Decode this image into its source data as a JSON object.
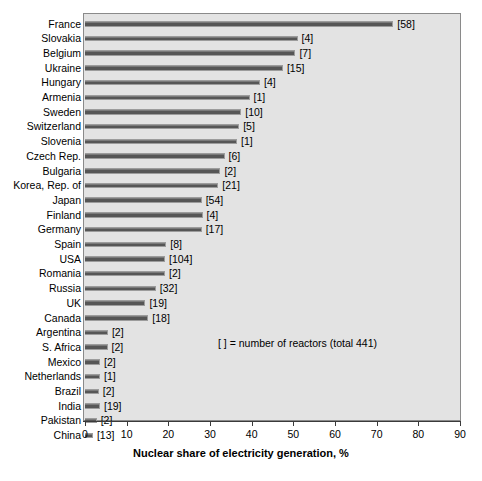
{
  "chart_data": {
    "type": "bar",
    "orientation": "horizontal",
    "title": "",
    "xlabel": "Nuclear share of electricity generation, %",
    "ylabel": "",
    "xlim": [
      0,
      90
    ],
    "xticks": [
      0,
      10,
      20,
      30,
      40,
      50,
      60,
      70,
      80,
      90
    ],
    "grid": false,
    "legend": null,
    "annotation": "[  ] = number of reactors (total 441)",
    "value_label_format": "[n_reactors]",
    "categories": [
      "France",
      "Slovakia",
      "Belgium",
      "Ukraine",
      "Hungary",
      "Armenia",
      "Sweden",
      "Switzerland",
      "Slovenia",
      "Czech Rep.",
      "Bulgaria",
      "Korea, Rep. of",
      "Japan",
      "Finland",
      "Germany",
      "Spain",
      "USA",
      "Romania",
      "Russia",
      "UK",
      "Canada",
      "Argentina",
      "S. Africa",
      "Mexico",
      "Netherlands",
      "Brazil",
      "India",
      "Pakistan",
      "China"
    ],
    "values": [
      74.0,
      51.0,
      50.5,
      47.5,
      42.0,
      39.5,
      37.5,
      37.0,
      36.5,
      33.5,
      32.5,
      32.0,
      28.0,
      28.2,
      28.0,
      19.5,
      19.2,
      19.2,
      17.0,
      14.5,
      15.2,
      5.5,
      5.4,
      3.6,
      3.6,
      3.3,
      3.6,
      2.8,
      1.9
    ],
    "reactors": [
      58,
      4,
      7,
      15,
      4,
      1,
      10,
      5,
      1,
      6,
      2,
      21,
      54,
      4,
      17,
      8,
      104,
      2,
      32,
      19,
      18,
      2,
      2,
      2,
      1,
      2,
      19,
      2,
      13
    ],
    "total_reactors": 441,
    "colors": {
      "bar_fill": "#565656",
      "bar_edge": "#9c9c9c",
      "plot_background": "#e3e3e3",
      "figure_background": "#ffffff",
      "axis": "#3a3a3a",
      "text": "#000000"
    }
  }
}
